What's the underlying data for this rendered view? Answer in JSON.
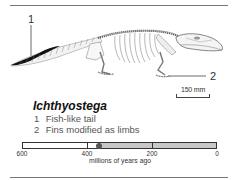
{
  "figure": {
    "title": "Ichthyostega",
    "callouts": [
      {
        "number": "1",
        "text": "Fish-like tail"
      },
      {
        "number": "2",
        "text": "Fins modified as limbs"
      }
    ],
    "scale_bar": {
      "label": "150 mm"
    },
    "illustration": {
      "subject": "Ichthyostega skeleton, lateral view",
      "icon": "skeleton-illustration"
    }
  },
  "timeline": {
    "caption": "millions of years ago",
    "ticks": [
      {
        "value": 600,
        "label": "600"
      },
      {
        "value": 400,
        "label": "400"
      },
      {
        "value": 200,
        "label": "200"
      },
      {
        "value": 0,
        "label": "0"
      }
    ],
    "domain": [
      600,
      0
    ],
    "range_start": 365,
    "range_end": 0,
    "marker_value": 363,
    "colors": {
      "range": "#c8c8c8",
      "marker": "#555555",
      "border": "#333333"
    }
  }
}
